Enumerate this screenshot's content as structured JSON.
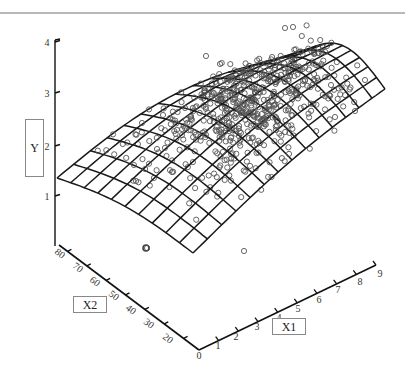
{
  "chart_data": {
    "type": "scatter",
    "subtype": "3d-scatter-with-fitted-surface",
    "title": "",
    "axes": {
      "y": {
        "label": "Y",
        "ticks": [
          "1",
          "2",
          "3",
          "4"
        ],
        "range": [
          0.5,
          4
        ]
      },
      "x1": {
        "label": "X1",
        "ticks": [
          "0",
          "1",
          "2",
          "3",
          "4",
          "5",
          "6",
          "7",
          "8",
          "9"
        ],
        "range": [
          0,
          9
        ]
      },
      "x2": {
        "label": "X2",
        "ticks": [
          "80",
          "70",
          "60",
          "50",
          "40",
          "30",
          "20"
        ],
        "range": [
          20,
          80
        ]
      }
    },
    "surface": {
      "description": "Fitted curved wireframe surface; lowest near X1=0, rising toward X1=9 and mid X2",
      "grid_rows": 10,
      "grid_cols": 14,
      "corner_values": {
        "x1_0_x2_80": 1.3,
        "x1_0_x2_20": 0.9,
        "x1_9_x2_80": 3.6,
        "x1_9_x2_20": 2.2
      }
    },
    "points": {
      "marker": "open-circle",
      "approx_count": 600,
      "description": "Observed data points scattered around the fitted surface, densest near X1 4-6, X2 40-60"
    },
    "grid": false,
    "legend": null
  },
  "labels": {
    "y_box": "Y",
    "x1_box": "X1",
    "x2_box": "X2"
  },
  "y_ticks": [
    {
      "label": "4",
      "y": 42
    },
    {
      "label": "3",
      "y": 93
    },
    {
      "label": "2",
      "y": 146
    },
    {
      "label": "1",
      "y": 196
    }
  ],
  "x2_ticks": [
    {
      "label": "80",
      "x": 58,
      "y": 256
    },
    {
      "label": "70",
      "x": 76,
      "y": 270
    },
    {
      "label": "60",
      "x": 93,
      "y": 284
    },
    {
      "label": "50",
      "x": 112,
      "y": 298
    },
    {
      "label": "40",
      "x": 129,
      "y": 312
    },
    {
      "label": "30",
      "x": 147,
      "y": 326
    },
    {
      "label": "20",
      "x": 166,
      "y": 341
    }
  ],
  "x1_ticks": [
    {
      "label": "0",
      "x": 199,
      "y": 359
    },
    {
      "label": "1",
      "x": 218,
      "y": 349
    },
    {
      "label": "2",
      "x": 236,
      "y": 340
    },
    {
      "label": "3",
      "x": 257,
      "y": 330
    },
    {
      "label": "4",
      "x": 279,
      "y": 321
    },
    {
      "label": "5",
      "x": 298,
      "y": 312
    },
    {
      "label": "6",
      "x": 319,
      "y": 303
    },
    {
      "label": "7",
      "x": 338,
      "y": 293
    },
    {
      "label": "8",
      "x": 360,
      "y": 285
    },
    {
      "label": "9",
      "x": 380,
      "y": 277
    }
  ],
  "colors": {
    "axis": "#111111",
    "mesh": "#1a1a1a",
    "points": "#555555",
    "label_box_border": "#888888",
    "topline": "#b8b8b8"
  }
}
